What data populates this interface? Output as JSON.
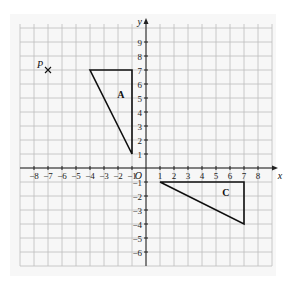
{
  "diagram": {
    "type": "coordinate-grid",
    "grid": {
      "x_min": -9,
      "x_max": 9,
      "y_min": -7,
      "y_max": 10,
      "pitch_px": 14,
      "origin_px": [
        146,
        168
      ],
      "grid_color": "#bdbdbd",
      "background": "#f7f7f7"
    },
    "axes": {
      "x_label": "x",
      "y_label": "y",
      "origin_label": "O",
      "x_ticks": [
        "-8",
        "-7",
        "-6",
        "-5",
        "-4",
        "-3",
        "-2",
        "-1",
        "1",
        "2",
        "3",
        "4",
        "5",
        "6",
        "7",
        "8"
      ],
      "x_tick_values": [
        -8,
        -7,
        -6,
        -5,
        -4,
        -3,
        -2,
        -1,
        1,
        2,
        3,
        4,
        5,
        6,
        7,
        8
      ],
      "y_ticks": [
        "9",
        "8",
        "7",
        "6",
        "5",
        "4",
        "3",
        "2",
        "1",
        "-1",
        "-2",
        "-3",
        "-4",
        "-5",
        "-6"
      ],
      "y_tick_values": [
        9,
        8,
        7,
        6,
        5,
        4,
        3,
        2,
        1,
        -1,
        -2,
        -3,
        -4,
        -5,
        -6
      ]
    },
    "point_P": {
      "label": "P",
      "x": -7,
      "y": 7,
      "marker": "cross-icon"
    },
    "shapes": [
      {
        "label": "A",
        "vertices": [
          [
            -4,
            7
          ],
          [
            -1,
            7
          ],
          [
            -1,
            1
          ]
        ],
        "label_pos": [
          -1.8,
          5.2
        ]
      },
      {
        "label": "C",
        "vertices": [
          [
            1,
            -1
          ],
          [
            7,
            -1
          ],
          [
            7,
            -4
          ]
        ],
        "label_pos": [
          5.7,
          -1.8
        ]
      }
    ]
  }
}
